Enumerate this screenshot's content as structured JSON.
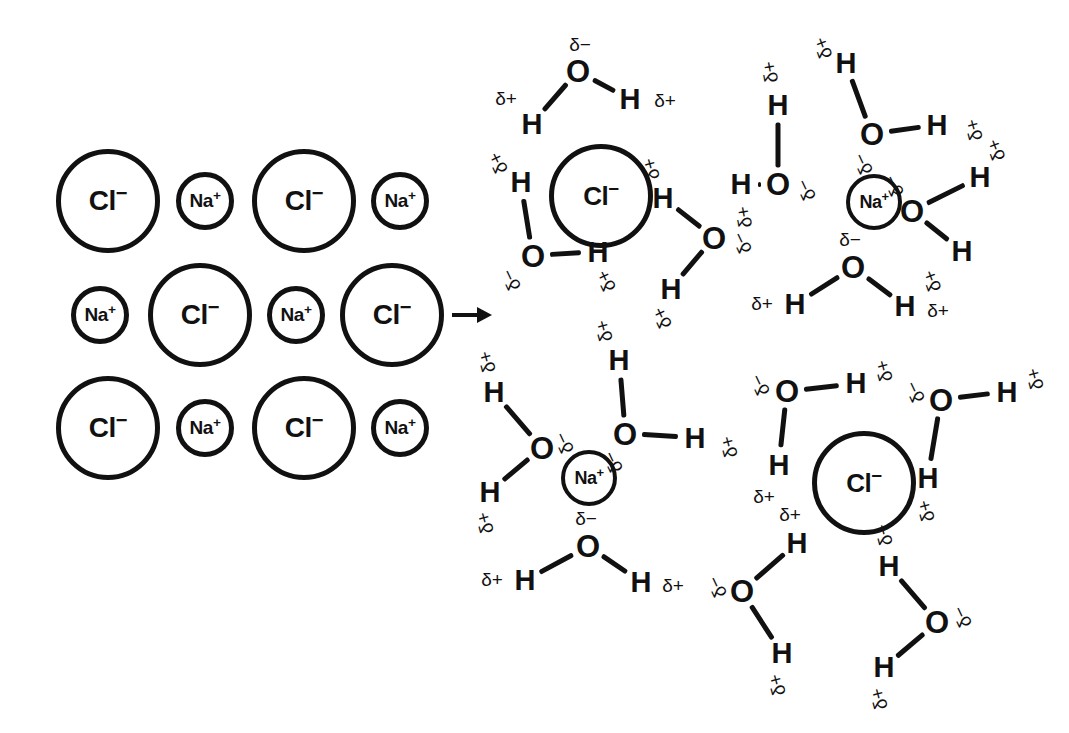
{
  "figure": {
    "background_color": "#ffffff",
    "ink_color": "#111111",
    "process_arrow": "right-arrow"
  },
  "labels": {
    "chloride": "Cl",
    "chloride_charge": "−",
    "sodium": "Na",
    "sodium_charge": "+",
    "oxygen": "O",
    "hydrogen": "H",
    "delta_negative": "δ−",
    "delta_positive": "δ+"
  },
  "chart_data": {
    "type": "diagram",
    "crystal": {
      "label": "NaCl ionic lattice",
      "rows": [
        {
          "row": 1,
          "ions": [
            "Cl-",
            "Na+",
            "Cl-",
            "Na+"
          ]
        },
        {
          "row": 2,
          "ions": [
            "Na+",
            "Cl-",
            "Na+",
            "Cl-"
          ]
        },
        {
          "row": 3,
          "ions": [
            "Cl-",
            "Na+",
            "Cl-",
            "Na+"
          ]
        }
      ],
      "anion_label": "Cl−",
      "cation_label": "Na+",
      "anion_radius_px": 52,
      "cation_radius_px": 29
    },
    "solution": {
      "label": "Hydrated ions in aqueous solution",
      "clusters": [
        {
          "id": "cl-top-left",
          "ion": "Cl−",
          "water_count": 4,
          "water_orientation": "hydrogen (δ+) points toward anion"
        },
        {
          "id": "na-top-right",
          "ion": "Na+",
          "water_count": 4,
          "water_orientation": "oxygen (δ−) points toward cation"
        },
        {
          "id": "na-bottom-left",
          "ion": "Na+",
          "water_count": 3,
          "water_orientation": "oxygen (δ−) points toward cation"
        },
        {
          "id": "cl-bottom-right",
          "ion": "Cl−",
          "water_count": 4,
          "water_orientation": "hydrogen (δ+) points toward anion"
        }
      ],
      "water_partial_charges": {
        "oxygen": "δ−",
        "hydrogen": "δ+"
      }
    }
  },
  "crystal_ions": [
    {
      "id": "c-r1-1",
      "species": "Cl",
      "charge": "−",
      "size": "large",
      "x": 108,
      "y": 201
    },
    {
      "id": "c-r1-2",
      "species": "Na",
      "charge": "+",
      "size": "small",
      "x": 205,
      "y": 201
    },
    {
      "id": "c-r1-3",
      "species": "Cl",
      "charge": "−",
      "size": "large",
      "x": 304,
      "y": 201
    },
    {
      "id": "c-r1-4",
      "species": "Na",
      "charge": "+",
      "size": "small",
      "x": 400,
      "y": 201
    },
    {
      "id": "c-r2-1",
      "species": "Na",
      "charge": "+",
      "size": "small",
      "x": 100,
      "y": 315
    },
    {
      "id": "c-r2-2",
      "species": "Cl",
      "charge": "−",
      "size": "large",
      "x": 200,
      "y": 315
    },
    {
      "id": "c-r2-3",
      "species": "Na",
      "charge": "+",
      "size": "small",
      "x": 296,
      "y": 315
    },
    {
      "id": "c-r2-4",
      "species": "Cl",
      "charge": "−",
      "size": "large",
      "x": 392,
      "y": 315
    },
    {
      "id": "c-r3-1",
      "species": "Cl",
      "charge": "−",
      "size": "large",
      "x": 108,
      "y": 428
    },
    {
      "id": "c-r3-2",
      "species": "Na",
      "charge": "+",
      "size": "small",
      "x": 205,
      "y": 428
    },
    {
      "id": "c-r3-3",
      "species": "Cl",
      "charge": "−",
      "size": "large",
      "x": 304,
      "y": 428
    },
    {
      "id": "c-r3-4",
      "species": "Na",
      "charge": "+",
      "size": "small",
      "x": 400,
      "y": 428
    }
  ],
  "solvated_ions": [
    {
      "id": "s-cl-1",
      "species": "Cl",
      "charge": "−",
      "size": "large",
      "x": 601,
      "y": 196
    },
    {
      "id": "s-na-1",
      "species": "Na",
      "charge": "+",
      "size": "small",
      "x": 874,
      "y": 202
    },
    {
      "id": "s-na-2",
      "species": "Na",
      "charge": "+",
      "size": "small",
      "x": 589,
      "y": 478
    },
    {
      "id": "s-cl-2",
      "species": "Cl",
      "charge": "−",
      "size": "large",
      "x": 864,
      "y": 483
    }
  ],
  "water_molecules": [
    {
      "id": "w1",
      "cluster": "cl-top-left",
      "o": {
        "x": 578,
        "y": 71
      },
      "o_charge": {
        "text": "δ−",
        "x": 580,
        "y": 44,
        "rot": 0
      },
      "h": [
        {
          "x": 532,
          "y": 124,
          "charge": {
            "text": "δ+",
            "x": 506,
            "y": 98,
            "rot": 0
          }
        },
        {
          "x": 630,
          "y": 99,
          "charge": {
            "text": "δ+",
            "x": 665,
            "y": 100,
            "rot": 0
          }
        }
      ]
    },
    {
      "id": "w2",
      "cluster": "cl-top-left",
      "o": {
        "x": 533,
        "y": 256
      },
      "o_charge": {
        "text": "δ−",
        "x": 511,
        "y": 280,
        "rot": -115
      },
      "h": [
        {
          "x": 521,
          "y": 182,
          "charge": {
            "text": "δ+",
            "x": 498,
            "y": 163,
            "rot": -115
          }
        },
        {
          "x": 598,
          "y": 252,
          "charge": {
            "text": "δ+",
            "x": 606,
            "y": 281,
            "rot": -115
          }
        }
      ]
    },
    {
      "id": "w3",
      "cluster": "cl-top-left",
      "o": {
        "x": 714,
        "y": 238
      },
      "o_charge": {
        "text": "δ−",
        "x": 742,
        "y": 243,
        "rot": -115
      },
      "h": [
        {
          "x": 663,
          "y": 198,
          "charge": {
            "text": "δ+",
            "x": 651,
            "y": 169,
            "rot": -105
          }
        },
        {
          "x": 671,
          "y": 289,
          "charge": {
            "text": "δ+",
            "x": 662,
            "y": 318,
            "rot": -115
          }
        }
      ]
    },
    {
      "id": "w4",
      "cluster": "na-top-right",
      "o": {
        "x": 778,
        "y": 184
      },
      "o_charge": {
        "text": "δ−",
        "x": 806,
        "y": 190,
        "rot": -115
      },
      "h": [
        {
          "x": 778,
          "y": 105,
          "charge": {
            "text": "δ+",
            "x": 770,
            "y": 72,
            "rot": -100
          }
        },
        {
          "x": 741,
          "y": 184,
          "charge": {
            "text": "δ+",
            "x": 744,
            "y": 217,
            "rot": -100
          }
        }
      ]
    },
    {
      "id": "w5",
      "cluster": "na-top-right",
      "o": {
        "x": 872,
        "y": 134
      },
      "o_charge": {
        "text": "δ−",
        "x": 863,
        "y": 164,
        "rot": -115
      },
      "h": [
        {
          "x": 846,
          "y": 63,
          "charge": {
            "text": "δ+",
            "x": 823,
            "y": 48,
            "rot": -110
          }
        },
        {
          "x": 937,
          "y": 125,
          "charge": {
            "text": "δ+",
            "x": 974,
            "y": 130,
            "rot": -105
          }
        }
      ]
    },
    {
      "id": "w6",
      "cluster": "na-top-right",
      "o": {
        "x": 912,
        "y": 211
      },
      "o_charge": {
        "text": "δ−",
        "x": 894,
        "y": 186,
        "rot": -115
      },
      "h": [
        {
          "x": 980,
          "y": 177,
          "charge": {
            "text": "δ+",
            "x": 996,
            "y": 150,
            "rot": -110
          }
        },
        {
          "x": 962,
          "y": 251,
          "charge": {
            "text": "δ+",
            "x": 932,
            "y": 281,
            "rot": -110
          }
        }
      ]
    },
    {
      "id": "w7",
      "cluster": "na-top-right",
      "o": {
        "x": 853,
        "y": 267
      },
      "o_charge": {
        "text": "δ−",
        "x": 850,
        "y": 239,
        "rot": 0
      },
      "h": [
        {
          "x": 795,
          "y": 304,
          "charge": {
            "text": "δ+",
            "x": 762,
            "y": 303,
            "rot": 0
          }
        },
        {
          "x": 905,
          "y": 306,
          "charge": {
            "text": "δ+",
            "x": 938,
            "y": 310,
            "rot": 0
          }
        }
      ]
    },
    {
      "id": "w8",
      "cluster": "na-bottom-left",
      "o": {
        "x": 542,
        "y": 448
      },
      "o_charge": {
        "text": "δ−",
        "x": 564,
        "y": 443,
        "rot": -115
      },
      "h": [
        {
          "x": 494,
          "y": 392,
          "charge": {
            "text": "δ+",
            "x": 487,
            "y": 362,
            "rot": -105
          }
        },
        {
          "x": 490,
          "y": 492,
          "charge": {
            "text": "δ+",
            "x": 485,
            "y": 523,
            "rot": -105
          }
        }
      ]
    },
    {
      "id": "w9",
      "cluster": "na-bottom-left",
      "o": {
        "x": 625,
        "y": 434
      },
      "o_charge": {
        "text": "δ−",
        "x": 613,
        "y": 462,
        "rot": -115
      },
      "h": [
        {
          "x": 619,
          "y": 360,
          "charge": {
            "text": "δ+",
            "x": 604,
            "y": 331,
            "rot": -105
          }
        },
        {
          "x": 695,
          "y": 438,
          "charge": {
            "text": "δ+",
            "x": 729,
            "y": 447,
            "rot": -105
          }
        }
      ]
    },
    {
      "id": "w10",
      "cluster": "na-bottom-left",
      "o": {
        "x": 588,
        "y": 546
      },
      "o_charge": {
        "text": "δ−",
        "x": 586,
        "y": 518,
        "rot": 0
      },
      "h": [
        {
          "x": 525,
          "y": 580,
          "charge": {
            "text": "δ+",
            "x": 492,
            "y": 579,
            "rot": 0
          }
        },
        {
          "x": 641,
          "y": 582,
          "charge": {
            "text": "δ+",
            "x": 673,
            "y": 585,
            "rot": 0
          }
        }
      ]
    },
    {
      "id": "w11",
      "cluster": "cl-bottom-right",
      "o": {
        "x": 787,
        "y": 391
      },
      "o_charge": {
        "text": "δ−",
        "x": 760,
        "y": 385,
        "rot": -115
      },
      "h": [
        {
          "x": 856,
          "y": 383,
          "charge": {
            "text": "δ+",
            "x": 884,
            "y": 371,
            "rot": -105
          }
        },
        {
          "x": 779,
          "y": 465,
          "charge": {
            "text": "δ+",
            "x": 764,
            "y": 496,
            "rot": 0
          }
        }
      ]
    },
    {
      "id": "w12",
      "cluster": "cl-bottom-right",
      "o": {
        "x": 941,
        "y": 400
      },
      "o_charge": {
        "text": "δ−",
        "x": 915,
        "y": 392,
        "rot": -115
      },
      "h": [
        {
          "x": 1007,
          "y": 392,
          "charge": {
            "text": "δ+",
            "x": 1035,
            "y": 379,
            "rot": -105
          }
        },
        {
          "x": 928,
          "y": 478,
          "charge": {
            "text": "δ+",
            "x": 926,
            "y": 511,
            "rot": -105
          }
        }
      ]
    },
    {
      "id": "w13",
      "cluster": "cl-bottom-right",
      "o": {
        "x": 742,
        "y": 591
      },
      "o_charge": {
        "text": "δ−",
        "x": 717,
        "y": 587,
        "rot": -115
      },
      "h": [
        {
          "x": 797,
          "y": 543,
          "charge": {
            "text": "δ+",
            "x": 790,
            "y": 514,
            "rot": 0
          }
        },
        {
          "x": 782,
          "y": 653,
          "charge": {
            "text": "δ+",
            "x": 777,
            "y": 685,
            "rot": -105
          }
        }
      ]
    },
    {
      "id": "w14",
      "cluster": "cl-bottom-right",
      "o": {
        "x": 937,
        "y": 622
      },
      "o_charge": {
        "text": "δ−",
        "x": 962,
        "y": 617,
        "rot": -115
      },
      "h": [
        {
          "x": 889,
          "y": 566,
          "charge": {
            "text": "δ+",
            "x": 884,
            "y": 535,
            "rot": -105
          }
        },
        {
          "x": 884,
          "y": 667,
          "charge": {
            "text": "δ+",
            "x": 879,
            "y": 699,
            "rot": -105
          }
        }
      ]
    }
  ]
}
